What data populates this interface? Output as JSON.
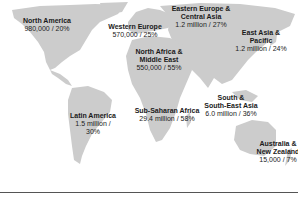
{
  "map": {
    "land_color": "#cccccc",
    "background_color": "#ffffff",
    "regions": [
      {
        "id": "north-america",
        "name": "North America",
        "stat": "980,000 / 20%",
        "x": 47,
        "y": 21
      },
      {
        "id": "western-europe",
        "name": "Western Europe",
        "stat": "570,000 / 25%",
        "x": 135,
        "y": 24
      },
      {
        "id": "eastern-europe-central-asia",
        "name": "Eastern Europe & Central Asia",
        "name_lines": [
          "Eastern Europe &",
          "Central Asia"
        ],
        "stat": "1.2 million / 27%",
        "x": 200,
        "y": 6
      },
      {
        "id": "east-asia-pacific",
        "name": "East Asia & Pacific",
        "name_lines": [
          "East Asia &",
          "Pacific"
        ],
        "stat": "1.2 million / 24%",
        "x": 262,
        "y": 30
      },
      {
        "id": "north-africa-middle-east",
        "name": "North Africa & Middle East",
        "name_lines": [
          "North Africa &",
          "Middle East"
        ],
        "stat": "550,000 / 55%",
        "x": 158,
        "y": 50
      },
      {
        "id": "south-southeast-asia",
        "name": "South & South-East Asia",
        "name_lines": [
          "South &",
          "South-East Asia"
        ],
        "stat": "6.0 million / 36%",
        "x": 230,
        "y": 96
      },
      {
        "id": "latin-america",
        "name": "Latin America",
        "name_lines": [
          "Latin America"
        ],
        "stat_lines": [
          "1.5 million /",
          "30%"
        ],
        "x": 93,
        "y": 113
      },
      {
        "id": "sub-saharan-africa",
        "name": "Sub-Saharan Africa",
        "stat": "29.4 million / 58%",
        "x": 166,
        "y": 108
      },
      {
        "id": "australia-new-zealand",
        "name": "Australia & New Zealand",
        "name_lines": [
          "Australia &",
          "New Zealand"
        ],
        "stat": "15,000 / 7%",
        "x": 281,
        "y": 140
      }
    ]
  }
}
